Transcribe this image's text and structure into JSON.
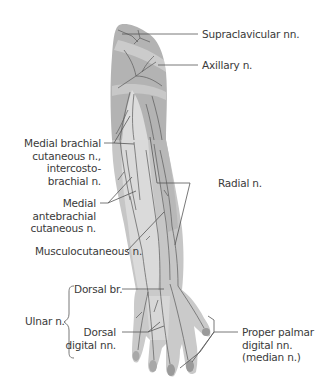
{
  "diagram": {
    "colors": {
      "skin_dark": "#b3b3b3",
      "skin_mid": "#c6c6c6",
      "skin_light": "#dcdcdc",
      "nerve": "#5a5a5a",
      "leader": "#555555",
      "text": "#3a3a3a"
    },
    "labels": {
      "supraclavicular": "Supraclavicular nn.",
      "axillary": "Axillary n.",
      "medial_brachial_1": "Medial brachial",
      "medial_brachial_2": "cutaneous n.,",
      "medial_brachial_3": "intercosto-",
      "medial_brachial_4": "brachial n.",
      "radial": "Radial n.",
      "medial_antebrachial_1": "Medial",
      "medial_antebrachial_2": "antebrachial",
      "medial_antebrachial_3": "cutaneous n.",
      "musculocutaneous": "Musculocutaneous n.",
      "ulnar": "Ulnar n.",
      "dorsal_br": "Dorsal br.",
      "dorsal_digital_1": "Dorsal",
      "dorsal_digital_2": "digital nn.",
      "proper_palmar_1": "Proper palmar",
      "proper_palmar_2": "digital nn.",
      "proper_palmar_3": "(median n.)"
    }
  }
}
